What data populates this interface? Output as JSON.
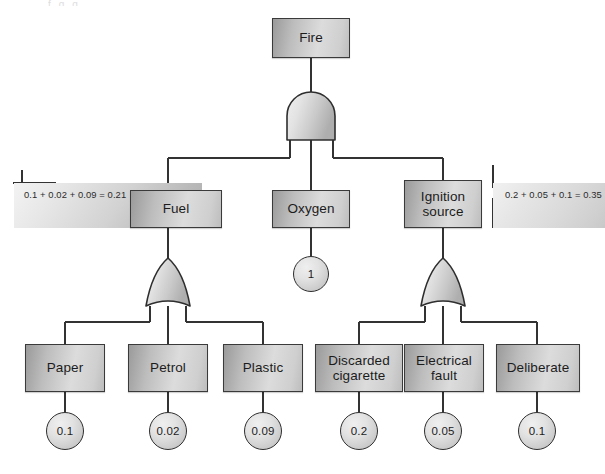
{
  "diagram": {
    "type": "fault-tree",
    "ghost_header": "f  g  g",
    "top_event": {
      "label": "Fire"
    },
    "gates": [
      {
        "id": "and-gate-top",
        "type": "AND",
        "output": "Fire",
        "inputs": [
          "Fuel",
          "Oxygen",
          "Ignition source"
        ]
      },
      {
        "id": "or-gate-fuel",
        "type": "OR",
        "output": "Fuel",
        "inputs": [
          "Paper",
          "Petrol",
          "Plastic"
        ]
      },
      {
        "id": "or-gate-ignition",
        "type": "OR",
        "output": "Ignition source",
        "inputs": [
          "Discarded cigarette",
          "Electrical fault",
          "Deliberate"
        ]
      }
    ],
    "intermediate_events": [
      {
        "id": "fuel",
        "label": "Fuel"
      },
      {
        "id": "oxygen",
        "label": "Oxygen"
      },
      {
        "id": "ignition-source",
        "label": "Ignition\nsource"
      }
    ],
    "basic_events": [
      {
        "id": "paper",
        "label": "Paper",
        "probability": "0.1"
      },
      {
        "id": "petrol",
        "label": "Petrol",
        "probability": "0.02"
      },
      {
        "id": "plastic",
        "label": "Plastic",
        "probability": "0.09"
      },
      {
        "id": "discarded-cigarette",
        "label": "Discarded\ncigarette",
        "probability": "0.2"
      },
      {
        "id": "electrical-fault",
        "label": "Electrical\nfault",
        "probability": "0.05"
      },
      {
        "id": "deliberate",
        "label": "Deliberate",
        "probability": "0.1"
      }
    ],
    "oxygen_probability": "1",
    "annotations": [
      {
        "id": "fuel-calc",
        "side": "left",
        "text": "0.1 + 0.02 + 0.09 = 0.21",
        "result": "0.21"
      },
      {
        "id": "ignition-calc",
        "side": "right",
        "text": "0.2 + 0.05 + 0.1 = 0.35",
        "result": "0.35"
      }
    ],
    "colors": {
      "box_border": "#3a3a3a",
      "box_fill_light": "#dcdcdc",
      "box_fill_dark": "#9a9a9a",
      "circle_border": "#2e2e2e",
      "line": "#333333",
      "band_fill": "#d2d2d2",
      "text": "#1c1c1c",
      "background": "#ffffff"
    }
  }
}
